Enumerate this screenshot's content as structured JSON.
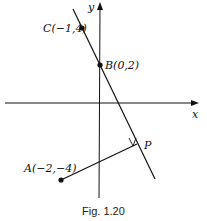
{
  "figure": {
    "caption": "Fig. 1.20",
    "axes": {
      "x_label": "x",
      "y_label": "y"
    },
    "points": {
      "C": {
        "label": "C(−1,4)",
        "coords": [
          -1,
          4
        ]
      },
      "B": {
        "label": "B(0,2)",
        "coords": [
          0,
          2
        ]
      },
      "A": {
        "label": "A(−2,−4)",
        "coords": [
          -2,
          -4
        ]
      },
      "P": {
        "label": "P"
      }
    },
    "elements": [
      "line through C and B",
      "perpendicular segment from A to P",
      "right-angle marker at P"
    ]
  }
}
